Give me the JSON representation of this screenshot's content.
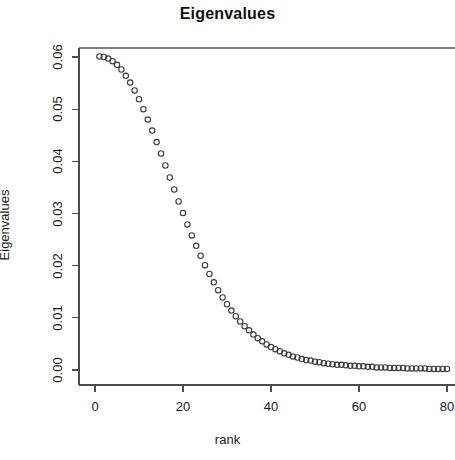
{
  "chart_data": {
    "type": "scatter",
    "title": "Eigenvalues",
    "xlabel": "rank",
    "ylabel": "Eigenvalues",
    "xlim": [
      0,
      81
    ],
    "ylim": [
      0.0,
      0.0625
    ],
    "grid": false,
    "legend": null,
    "marker": "open-circle",
    "marker_color": "#3a3a3a",
    "xticks": [
      "0",
      "20",
      "40",
      "60",
      "80"
    ],
    "xtick_values": [
      0,
      20,
      40,
      60,
      80
    ],
    "yticks": [
      "0.00",
      "0.01",
      "0.02",
      "0.03",
      "0.04",
      "0.05",
      "0.06"
    ],
    "ytick_values": [
      0.0,
      0.01,
      0.02,
      0.03,
      0.04,
      0.05,
      0.06
    ],
    "x": [
      1,
      2,
      3,
      4,
      5,
      6,
      7,
      8,
      9,
      10,
      11,
      12,
      13,
      14,
      15,
      16,
      17,
      18,
      19,
      20,
      21,
      22,
      23,
      24,
      25,
      26,
      27,
      28,
      29,
      30,
      31,
      32,
      33,
      34,
      35,
      36,
      37,
      38,
      39,
      40,
      41,
      42,
      43,
      44,
      45,
      46,
      47,
      48,
      49,
      50,
      51,
      52,
      53,
      54,
      55,
      56,
      57,
      58,
      59,
      60,
      61,
      62,
      63,
      64,
      65,
      66,
      67,
      68,
      69,
      70,
      71,
      72,
      73,
      74,
      75,
      76,
      77,
      78,
      79,
      80
    ],
    "y": [
      0.0601,
      0.06,
      0.0597,
      0.0592,
      0.0585,
      0.0576,
      0.0564,
      0.0551,
      0.0536,
      0.0519,
      0.05,
      0.048,
      0.0459,
      0.0437,
      0.0415,
      0.0392,
      0.0369,
      0.0346,
      0.0323,
      0.0301,
      0.0279,
      0.0258,
      0.0238,
      0.0219,
      0.0201,
      0.0184,
      0.0168,
      0.0153,
      0.0139,
      0.0126,
      0.0114,
      0.0103,
      0.0093,
      0.0084,
      0.0076,
      0.0068,
      0.0061,
      0.0055,
      0.0049,
      0.0044,
      0.004,
      0.0036,
      0.0032,
      0.0029,
      0.0026,
      0.0024,
      0.0021,
      0.0019,
      0.0018,
      0.0016,
      0.0015,
      0.0013,
      0.0012,
      0.0011,
      0.001,
      0.001,
      0.0009,
      0.0008,
      0.0008,
      0.0007,
      0.0007,
      0.0006,
      0.0006,
      0.0005,
      0.0005,
      0.0005,
      0.0004,
      0.0004,
      0.0004,
      0.0004,
      0.0003,
      0.0003,
      0.0003,
      0.0003,
      0.0003,
      0.0002,
      0.0002,
      0.0002,
      0.0002,
      0.0002
    ]
  }
}
